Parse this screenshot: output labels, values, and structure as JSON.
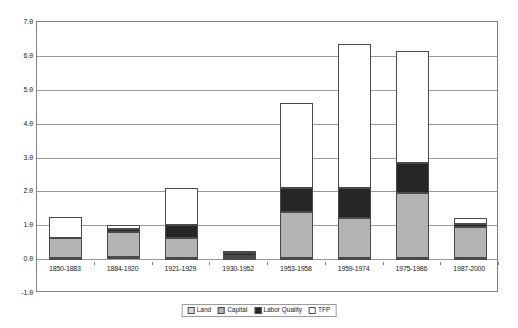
{
  "chart_data": {
    "type": "bar",
    "subtype": "stacked-column",
    "title": "",
    "xlabel": "",
    "ylabel": "",
    "ylim": [
      -1.0,
      7.0
    ],
    "ytick_step": 1.0,
    "yticks": [
      "7.0",
      "6.0",
      "5.0",
      "4.0",
      "3.0",
      "2.0",
      "1.0",
      "0.0",
      "-1.0"
    ],
    "ytick_values": [
      7.0,
      6.0,
      5.0,
      4.0,
      3.0,
      2.0,
      1.0,
      0.0,
      -1.0
    ],
    "grid": true,
    "grid_axis": "y",
    "legend_position": "bottom",
    "categories": [
      "1850-1883",
      "1884-1920",
      "1921-1929",
      "1930-1952",
      "1953-1958",
      "1959-1974",
      "1975-1986",
      "1987-2000"
    ],
    "series": [
      {
        "name": "Land",
        "color": "#d9d9d9",
        "values": [
          0.04,
          0.05,
          0.03,
          0.02,
          0.02,
          0.02,
          0.02,
          0.02
        ]
      },
      {
        "name": "Capital",
        "color": "#b3b3b3",
        "values": [
          0.59,
          0.75,
          0.59,
          0.08,
          1.38,
          1.18,
          1.93,
          0.93
        ]
      },
      {
        "name": "Labor Quality",
        "color": "#262626",
        "values": [
          0.0,
          0.08,
          0.38,
          0.07,
          0.7,
          0.9,
          0.9,
          0.1
        ]
      },
      {
        "name": "TFP",
        "color": "#ffffff",
        "values": [
          0.62,
          0.12,
          1.1,
          0.08,
          2.5,
          4.25,
          3.3,
          0.15
        ]
      }
    ],
    "totals": [
      1.25,
      1.0,
      2.1,
      0.25,
      4.6,
      6.35,
      6.15,
      1.2
    ]
  },
  "legend": {
    "items": [
      {
        "label": "Land",
        "swatch": "land-swatch"
      },
      {
        "label": "Capital",
        "swatch": "capital-swatch"
      },
      {
        "label": "Labor Quality",
        "swatch": "labor-quality-swatch"
      },
      {
        "label": "TFP",
        "swatch": "tfp-swatch"
      }
    ]
  }
}
